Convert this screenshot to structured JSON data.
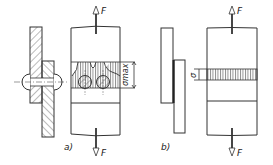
{
  "figure": {
    "part_a": {
      "label": "a)",
      "force_top": "F",
      "force_bottom": "F",
      "dimension_label": "σmax",
      "description": "riveted lap joint with stress concentration"
    },
    "part_b": {
      "label": "b)",
      "force_top": "F",
      "force_bottom": "F",
      "dimension_label": "σ",
      "description": "bonded lap joint with uniform stress"
    },
    "colors": {
      "line": "#333333",
      "hatch": "#555555",
      "background": "#ffffff"
    }
  }
}
